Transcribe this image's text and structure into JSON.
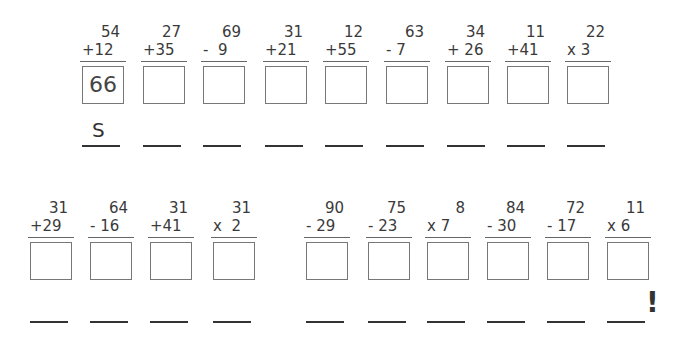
{
  "row1": [
    {
      "top": "54",
      "bottom": "+12",
      "answer": "66",
      "letter": "S"
    },
    {
      "top": "27",
      "bottom": "+35",
      "answer": "",
      "letter": ""
    },
    {
      "top": "69",
      "bottom": "-  9",
      "answer": "",
      "letter": ""
    },
    {
      "top": "31",
      "bottom": "+21",
      "answer": "",
      "letter": ""
    },
    {
      "top": "12",
      "bottom": "+55",
      "answer": "",
      "letter": ""
    },
    {
      "top": "63",
      "bottom": "- 7",
      "answer": "",
      "letter": ""
    },
    {
      "top": "34",
      "bottom": "+ 26",
      "answer": "",
      "letter": ""
    },
    {
      "top": "11",
      "bottom": "+41",
      "answer": "",
      "letter": ""
    },
    {
      "top": "22",
      "bottom": "x 3",
      "answer": "",
      "letter": ""
    }
  ],
  "row2": [
    {
      "top": "31",
      "bottom": "+29",
      "answer": "",
      "letter": ""
    },
    {
      "top": "64",
      "bottom": "- 16",
      "answer": "",
      "letter": ""
    },
    {
      "top": "31",
      "bottom": "+41",
      "answer": "",
      "letter": ""
    },
    {
      "top": "31",
      "bottom": "x  2",
      "answer": "",
      "letter": ""
    },
    {
      "top": "90",
      "bottom": "- 29",
      "answer": "",
      "letter": ""
    },
    {
      "top": "75",
      "bottom": "- 23",
      "answer": "",
      "letter": ""
    },
    {
      "top": "8",
      "bottom": "x 7",
      "answer": "",
      "letter": ""
    },
    {
      "top": "84",
      "bottom": "- 30",
      "answer": "",
      "letter": ""
    },
    {
      "top": "72",
      "bottom": "- 17",
      "answer": "",
      "letter": ""
    },
    {
      "top": "11",
      "bottom": "x 6",
      "answer": "",
      "letter": ""
    }
  ],
  "ending_punctuation": "!"
}
